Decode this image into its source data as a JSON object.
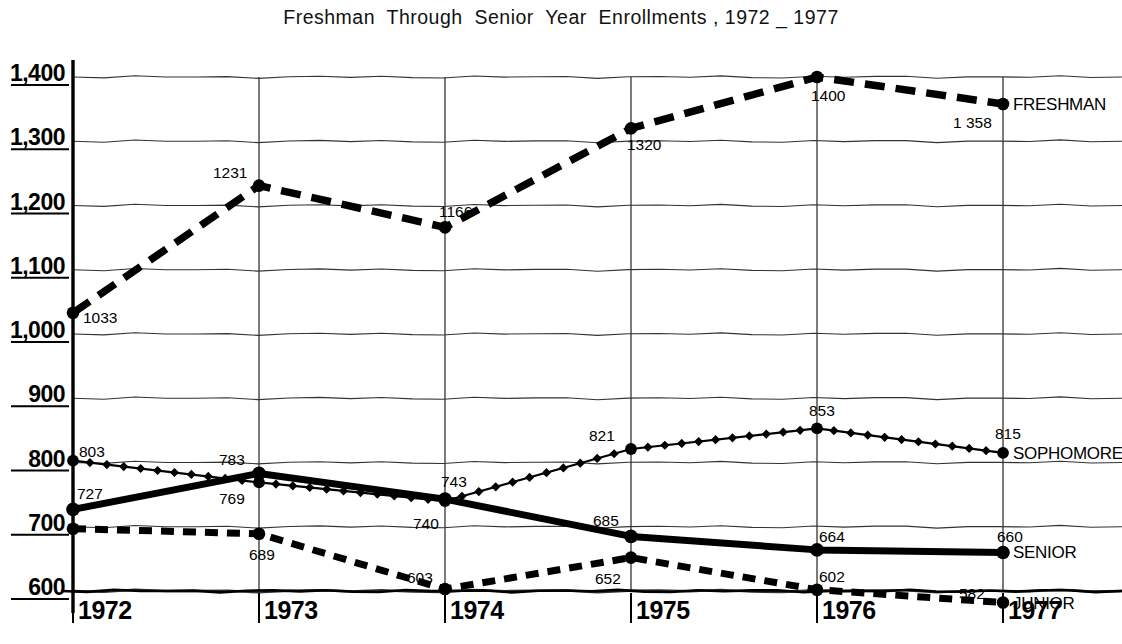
{
  "chart_data": {
    "type": "line",
    "title": "Freshman  Through  Senior  Year  Enrollments , 1972 _ 1977",
    "xlabel": "",
    "ylabel": "",
    "x": [
      "1972",
      "1973",
      "1974",
      "1975",
      "1976",
      "1977"
    ],
    "categories": [
      "1972",
      "1973",
      "1974",
      "1975",
      "1976",
      "1977"
    ],
    "ylim": [
      600,
      1400
    ],
    "yticks": [
      600,
      700,
      800,
      900,
      1000,
      1100,
      1200,
      1300,
      1400
    ],
    "ytick_labels": [
      "600",
      "700",
      "800",
      "900",
      "1,000",
      "1,100",
      "1,200",
      "1,300",
      "1,400"
    ],
    "xtick_labels": [
      "1972",
      "1973",
      "1974",
      "1975",
      "1976",
      "1977"
    ],
    "grid": true,
    "legend_position": "right-of-line-end",
    "series": [
      {
        "name": "FRESHMAN",
        "style": "long-dash",
        "values": [
          1033,
          1231,
          1166,
          1320,
          1400,
          1358
        ],
        "labels": [
          "1033",
          "1231",
          "1166",
          "1320",
          "1400",
          "1 358"
        ]
      },
      {
        "name": "SOPHOMORE",
        "style": "diamond-dotted",
        "values": [
          803,
          769,
          740,
          821,
          853,
          815
        ],
        "labels": [
          "803",
          "769",
          "740",
          "821",
          "853",
          "815"
        ]
      },
      {
        "name": "SENIOR",
        "style": "solid-thick",
        "values": [
          727,
          783,
          743,
          685,
          664,
          660
        ],
        "labels": [
          "727",
          "783",
          "743",
          "685",
          "664",
          "660"
        ]
      },
      {
        "name": "JUNIOR",
        "style": "short-dash",
        "values": [
          697,
          689,
          603,
          652,
          602,
          582
        ],
        "labels": [
          "",
          "689",
          "603",
          "652",
          "602",
          "582"
        ]
      }
    ]
  },
  "colors": {
    "ink": "#000000",
    "grid": "#2a2a2a",
    "background": "#ffffff"
  }
}
